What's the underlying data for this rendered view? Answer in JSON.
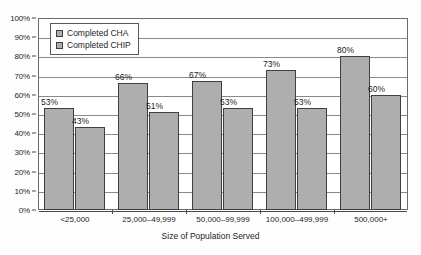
{
  "chart_data": {
    "type": "bar",
    "title": "",
    "xlabel": "Size of Population Served",
    "ylabel": "",
    "ylim": [
      0,
      100
    ],
    "ytick_labels": [
      "0%",
      "10%",
      "20%",
      "30%",
      "40%",
      "50%",
      "60%",
      "70%",
      "80%",
      "90%",
      "100%"
    ],
    "ytick_values": [
      0,
      10,
      20,
      30,
      40,
      50,
      60,
      70,
      80,
      90,
      100
    ],
    "grid": true,
    "legend_position": "upper-left-inside",
    "categories": [
      "<25,000",
      "25,000–49,999",
      "50,000–99,999",
      "100,000–499,999",
      "500,000+"
    ],
    "series": [
      {
        "name": "Completed CHA",
        "values": [
          53,
          66,
          67,
          73,
          80
        ],
        "labels": [
          "53%",
          "66%",
          "67%",
          "73%",
          "80%"
        ],
        "color": "#aeaeae"
      },
      {
        "name": "Completed CHIP",
        "values": [
          43,
          51,
          53,
          53,
          60
        ],
        "labels": [
          "43%",
          "51%",
          "53%",
          "53%",
          "60%"
        ],
        "color": "#aeaeae"
      }
    ]
  },
  "legend": {
    "items": [
      {
        "label": "Completed CHA"
      },
      {
        "label": "Completed CHIP"
      }
    ]
  },
  "axis": {
    "x_title": "Size of Population Served"
  }
}
